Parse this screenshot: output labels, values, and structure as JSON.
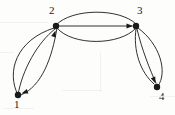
{
  "figure": {
    "type": "directed-multigraph-diagram",
    "background_color": "#fdfdfc",
    "ink_color": "#1a1a1a",
    "width": 175,
    "height": 115
  },
  "nodes": [
    {
      "id": "1",
      "label": "1",
      "x": 18,
      "y": 95,
      "label_x": 14,
      "label_y": 99,
      "radius": 3.2
    },
    {
      "id": "2",
      "label": "2",
      "x": 56,
      "y": 26,
      "label_x": 49,
      "label_y": 5,
      "radius": 3.2
    },
    {
      "id": "3",
      "label": "3",
      "x": 136,
      "y": 26,
      "label_x": 137,
      "label_y": 5,
      "radius": 3.2
    },
    {
      "id": "4",
      "label": "4",
      "x": 157,
      "y": 87,
      "label_x": 159,
      "label_y": 91,
      "radius": 3.2
    }
  ],
  "edges": [
    {
      "from": "1",
      "to": "2",
      "shape": "arc-outer-left",
      "directed": true,
      "arrow_at": "2",
      "path": "M 18 95 C 6 72 16 40 54 28"
    },
    {
      "from": "1",
      "to": "2",
      "shape": "arc-inner",
      "directed": false,
      "arrow_at": "",
      "path": "M 18 95 C 22 70 38 42 55 29"
    },
    {
      "from": "2",
      "to": "1",
      "shape": "arc-outer-right",
      "directed": true,
      "arrow_at": "1",
      "path": "M 57 28 C 52 58 42 86 21 95"
    },
    {
      "from": "2",
      "to": "3",
      "shape": "arc-upper",
      "directed": false,
      "arrow_at": "",
      "path": "M 56 25 C 72 8 120 8 136 24"
    },
    {
      "from": "2",
      "to": "3",
      "shape": "straight",
      "directed": true,
      "arrow_at": "3",
      "path": "M 58 26 L 132 26"
    },
    {
      "from": "2",
      "to": "3",
      "shape": "arc-lower",
      "directed": false,
      "arrow_at": "",
      "path": "M 57 28 C 72 46 120 46 136 28"
    },
    {
      "from": "3",
      "to": "4",
      "shape": "arc-inner-left",
      "directed": false,
      "arrow_at": "",
      "path": "M 136 29 C 133 50 140 72 154 84"
    },
    {
      "from": "3",
      "to": "4",
      "shape": "arc-middle",
      "directed": true,
      "arrow_at": "4",
      "path": "M 137 29 C 142 50 150 70 156 83"
    },
    {
      "from": "3",
      "to": "4",
      "shape": "arc-outer-right",
      "directed": false,
      "arrow_at": "",
      "path": "M 138 28 C 160 44 168 72 158 86"
    }
  ],
  "arrowheads": [
    {
      "on_node": "2",
      "x": 55.5,
      "y": 30.5,
      "angle": -72
    },
    {
      "on_node": "1",
      "x": 21.5,
      "y": 93.5,
      "angle": 160
    },
    {
      "on_node": "3",
      "x": 133,
      "y": 26,
      "angle": 0
    },
    {
      "on_node": "4",
      "x": 155.5,
      "y": 83.5,
      "angle": 68
    }
  ],
  "scan_artifacts": [
    {
      "x": 0,
      "y": 22,
      "w": 48,
      "h": 1
    },
    {
      "x": 0,
      "y": 52,
      "w": 14,
      "h": 1
    },
    {
      "x": 62,
      "y": 90,
      "w": 40,
      "h": 1
    },
    {
      "x": 100,
      "y": 52,
      "w": 1,
      "h": 40
    },
    {
      "x": 150,
      "y": 96,
      "w": 25,
      "h": 1
    },
    {
      "x": 4,
      "y": 108,
      "w": 30,
      "h": 1
    }
  ]
}
